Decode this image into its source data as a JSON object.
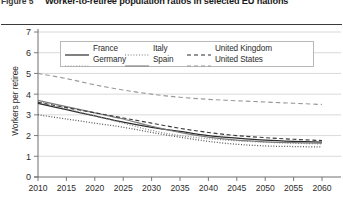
{
  "figure": {
    "label": "Figure 5",
    "title": "Worker-to-retiree population ratios in selected EU nations"
  },
  "legend": {
    "position": "top-center",
    "entries": [
      {
        "name": "France",
        "style": "solid",
        "icon": "solid-line-icon"
      },
      {
        "name": "Italy",
        "style": "dotted",
        "icon": "dotted-line-icon"
      },
      {
        "name": "United Kingdom",
        "style": "dashed",
        "icon": "dashed-line-icon"
      },
      {
        "name": "Germany",
        "style": "dotted",
        "icon": "dotted-line-icon"
      },
      {
        "name": "Spain",
        "style": "solid",
        "icon": "solid-line-icon"
      },
      {
        "name": "United States",
        "style": "dashed",
        "icon": "dashed-line-icon"
      }
    ]
  },
  "axes": {
    "y_title": "Workers per retiree",
    "y_ticks": [
      "0",
      "1",
      "2",
      "3",
      "4",
      "5",
      "6",
      "7"
    ],
    "x_ticks": [
      "2010",
      "2015",
      "2020",
      "2025",
      "2030",
      "2035",
      "2040",
      "2045",
      "2050",
      "2055",
      "2060"
    ]
  },
  "colors": {
    "line": "#3a3a3a",
    "grid": "#c9c9c9",
    "axis": "#6e6e6e",
    "text": "#2b2b2b",
    "rule": "#3a3a3a"
  },
  "chart_data": {
    "type": "line",
    "title": "Worker-to-retiree population ratios in selected EU nations",
    "xlabel": "",
    "ylabel": "Workers per retiree",
    "xlim": [
      2010,
      2060
    ],
    "ylim": [
      0,
      7
    ],
    "grid": true,
    "legend_position": "top-center",
    "x": [
      2010,
      2015,
      2020,
      2025,
      2030,
      2035,
      2040,
      2045,
      2050,
      2055,
      2060
    ],
    "series": [
      {
        "name": "France",
        "style": "solid",
        "values": [
          3.55,
          3.25,
          2.95,
          2.65,
          2.4,
          2.2,
          2.0,
          1.88,
          1.78,
          1.72,
          1.68
        ]
      },
      {
        "name": "Germany",
        "style": "dotted",
        "values": [
          3.65,
          3.3,
          2.95,
          2.6,
          2.25,
          2.0,
          1.85,
          1.75,
          1.68,
          1.63,
          1.6
        ]
      },
      {
        "name": "Italy",
        "style": "dotted",
        "values": [
          3.0,
          2.8,
          2.6,
          2.4,
          2.15,
          1.92,
          1.72,
          1.58,
          1.5,
          1.47,
          1.45
        ]
      },
      {
        "name": "Spain",
        "style": "solid",
        "values": [
          3.7,
          3.4,
          3.1,
          2.8,
          2.45,
          2.15,
          1.92,
          1.78,
          1.7,
          1.66,
          1.64
        ]
      },
      {
        "name": "United Kingdom",
        "style": "dashed",
        "values": [
          3.6,
          3.35,
          3.1,
          2.85,
          2.6,
          2.35,
          2.15,
          2.0,
          1.9,
          1.82,
          1.76
        ]
      },
      {
        "name": "United States",
        "style": "dashed",
        "values": [
          5.0,
          4.75,
          4.45,
          4.2,
          4.0,
          3.85,
          3.75,
          3.68,
          3.62,
          3.56,
          3.5
        ]
      }
    ]
  }
}
